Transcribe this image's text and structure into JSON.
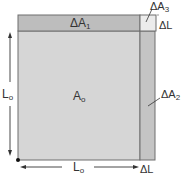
{
  "diagram": {
    "type": "area-expansion",
    "labels": {
      "a0": {
        "main": "A",
        "sub": "o"
      },
      "da1": {
        "main": "ΔA",
        "sub": "1"
      },
      "da2": {
        "main": "ΔA",
        "sub": "2"
      },
      "da3": {
        "main": "ΔA",
        "sub": "3"
      },
      "dl_top": {
        "main": "ΔL",
        "sub": ""
      },
      "dl_bottom": {
        "main": "ΔL",
        "sub": ""
      },
      "l0_left": {
        "main": "L",
        "sub": "o"
      },
      "l0_bottom": {
        "main": "L",
        "sub": "o"
      }
    },
    "colors": {
      "main_square": "#d6d6d6",
      "strip": "#bdbdbd",
      "corner": "#ececec",
      "outline": "#6e6e6e",
      "arrow": "#333333"
    }
  }
}
